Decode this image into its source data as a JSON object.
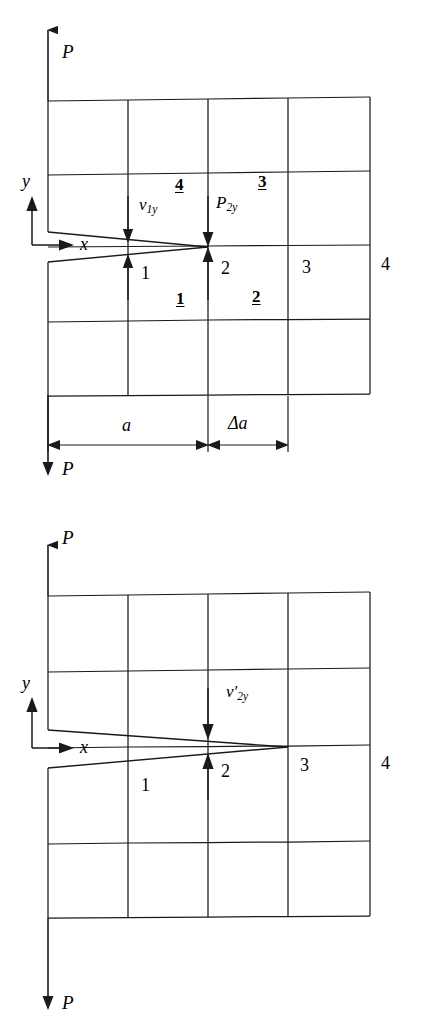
{
  "figure": {
    "stroke_color": "#1a1a1a",
    "background_color": "#ffffff",
    "panels": [
      {
        "id": "top-panel",
        "name": "crack-before-extension",
        "load_top_label": "P",
        "load_bottom_label": "P",
        "axis_x_label": "x",
        "axis_y_label": "y",
        "vectors": [
          {
            "name": "v1y",
            "base": "v",
            "sub": "1y",
            "prime": ""
          },
          {
            "name": "P2y",
            "base": "P",
            "sub": "2y",
            "prime": ""
          }
        ],
        "node_labels": [
          "1",
          "2",
          "3",
          "4"
        ],
        "element_labels": [
          "1",
          "2",
          "3",
          "4"
        ],
        "dimensions": [
          {
            "name": "crack-length",
            "label": "a"
          },
          {
            "name": "crack-extension",
            "label": "Δa"
          }
        ]
      },
      {
        "id": "bottom-panel",
        "name": "crack-after-extension",
        "load_top_label": "P",
        "load_bottom_label": "P",
        "axis_x_label": "x",
        "axis_y_label": "y",
        "vectors": [
          {
            "name": "v2y-prime",
            "base": "v",
            "sub": "2y",
            "prime": "′"
          }
        ],
        "node_labels": [
          "1",
          "2",
          "3",
          "4"
        ],
        "element_labels": [],
        "dimensions": []
      }
    ]
  },
  "top": {
    "load_top": "P",
    "load_bottom": "P",
    "axis_x": "x",
    "axis_y": "y",
    "v1y_base": "v",
    "v1y_sub": "1y",
    "p2y_base": "P",
    "p2y_sub": "2y",
    "node_1": "1",
    "node_2": "2",
    "node_3": "3",
    "node_4": "4",
    "elem_1": "1",
    "elem_2": "2",
    "elem_3": "3",
    "elem_4": "4",
    "dim_a": "a",
    "dim_da": "Δa"
  },
  "bottom": {
    "load_top": "P",
    "load_bottom": "P",
    "axis_x": "x",
    "axis_y": "y",
    "v2y_base": "v",
    "v2y_sub": "2y",
    "v2y_prime": "′",
    "node_1": "1",
    "node_2": "2",
    "node_3": "3",
    "node_4": "4"
  }
}
